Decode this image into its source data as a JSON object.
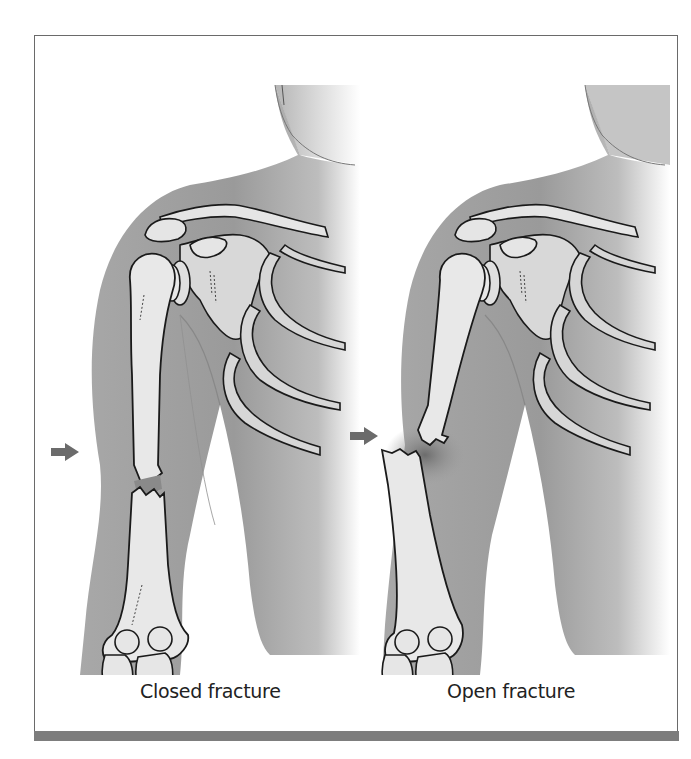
{
  "figure": {
    "panels": [
      {
        "id": "closed",
        "caption": "Closed fracture",
        "indicator": "arrow-right"
      },
      {
        "id": "open",
        "caption": "Open fracture",
        "indicator": "arrow-right"
      }
    ],
    "colors": {
      "skin": "#9c9c9c",
      "skin_light": "#c8c8c8",
      "bone": "#e6e6e6",
      "outline": "#1a1a1a",
      "arrow": "#6b6b6b",
      "frame_border": "#6a6a6a",
      "bottom_bar": "#7d7d7d"
    }
  }
}
